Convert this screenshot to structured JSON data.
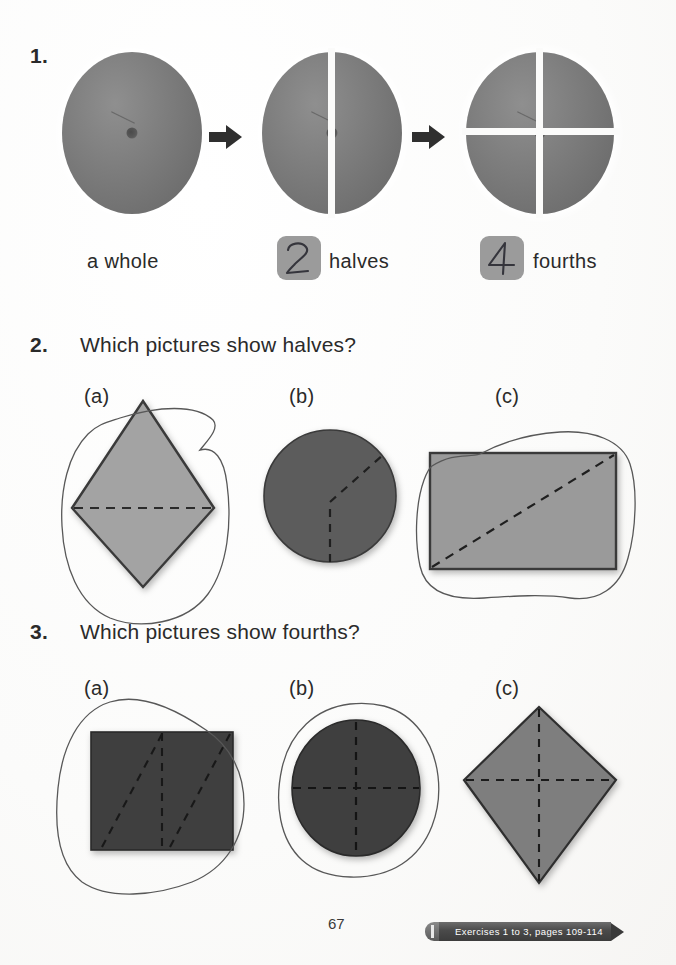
{
  "page": {
    "number": "67",
    "background_color": "#fdfdfc"
  },
  "exercise_tag": {
    "label": "Exercises 1 to 3, pages 109-114",
    "color": "#3c3c3c"
  },
  "items": [
    {
      "number": "1.",
      "captions": [
        {
          "text": "a whole",
          "boxed_digit": ""
        },
        {
          "text": "halves",
          "boxed_digit": "2"
        },
        {
          "text": "fourths",
          "boxed_digit": "4"
        }
      ]
    },
    {
      "number": "2.",
      "question": "Which pictures show halves?",
      "choices": [
        {
          "label": "(a)",
          "shape": "diamond",
          "fill": "#a3a3a3",
          "divided": "horizontal",
          "circled": true
        },
        {
          "label": "(b)",
          "shape": "circle",
          "fill": "#5c5c5c",
          "divided": "y-split",
          "circled": false
        },
        {
          "label": "(c)",
          "shape": "rectangle",
          "fill": "#9a9a9a",
          "divided": "diagonal",
          "circled": true
        }
      ]
    },
    {
      "number": "3.",
      "question": "Which pictures show fourths?",
      "choices": [
        {
          "label": "(a)",
          "shape": "square",
          "fill": "#3f3f3f",
          "divided": "vertical-plus-diagonals",
          "circled": true
        },
        {
          "label": "(b)",
          "shape": "circle",
          "fill": "#3f3f3f",
          "divided": "cross",
          "circled": true
        },
        {
          "label": "(c)",
          "shape": "kite",
          "fill": "#7e7e7e",
          "divided": "cross",
          "circled": false
        }
      ]
    }
  ],
  "colors": {
    "ink": "#2a2a2a",
    "pencil": "#6a6a6a",
    "numbox": "#9b9b9b",
    "orange": "#7a7a7a"
  }
}
